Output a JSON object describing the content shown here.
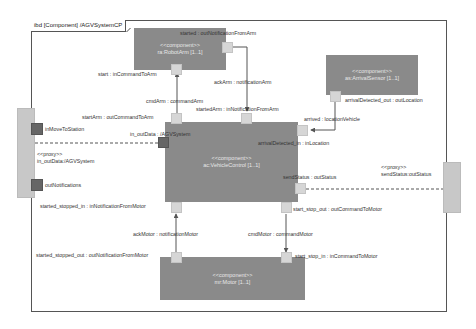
{
  "diagram": {
    "type": "SysML Internal Block Diagram",
    "frame_title": "ibd [Component] /AGVSystemCP",
    "colors": {
      "component_fill": "#8a8a8a",
      "port_light": "#d6d6d6",
      "port_dark": "#666666",
      "proxy_fill": "#c8c8c8",
      "line": "#555555"
    },
    "components": [
      {
        "id": "raRobotArm",
        "stereotype": "<<component>>",
        "name": "ra:RobotArm [1..1]"
      },
      {
        "id": "asArrivalSensor",
        "stereotype": "<<component>>",
        "name": "as:ArrivalSensor [1..1]"
      },
      {
        "id": "acVehicleControl",
        "stereotype": "<<component>>",
        "name": "ac:VehicleControl [1..1]"
      },
      {
        "id": "mrMotor",
        "stereotype": "<<component>>",
        "name": "mr:Motor [1..1]"
      }
    ],
    "ports": {
      "ra_started": "started : outNotificationFromArm",
      "ra_start": "start : inCommandToArm",
      "as_arrival_out": "arrivalDetected_out : outLocation",
      "ac_startArm": "startArm : outCommandToArm",
      "ac_startedArm": "startedArm : inNotificationFromArm",
      "ac_in_outData": "in_outData : /AGVSystem",
      "ac_arrival_in": "arrivalDetected_in : inLocation",
      "ac_sendStatus": "sendStatus : outStatus",
      "ac_started_stopped_in": "started_stopped_in : inNotificationFromMotor",
      "ac_start_stop_out": "start_stop_out : outCommandToMotor",
      "mr_started_stopped_out": "started_stopped_out : outNotificationFromMotor",
      "mr_start_stop_in": "start_stop_in : inCommandToMotor"
    },
    "connectors": {
      "cmdArm": "cmdArm : commandArm",
      "ackArm": "ackArm : notificationArm",
      "arrived": "arrived : locationVehicle",
      "ackMotor": "ackMotor : notificationMotor",
      "cmdMotor": "cmdMotor : commandMotor"
    },
    "boundary": {
      "left_ports": {
        "inMoveToStation": "inMoveToStation",
        "outNotifications": "outNotifications"
      },
      "left_proxy_stereo": "<<proxy>>",
      "left_proxy_name": "in_outData:/AGVSystem",
      "right_proxy_stereo": "<<proxy>>",
      "right_proxy_name": "sendStatus:outStatus"
    }
  }
}
